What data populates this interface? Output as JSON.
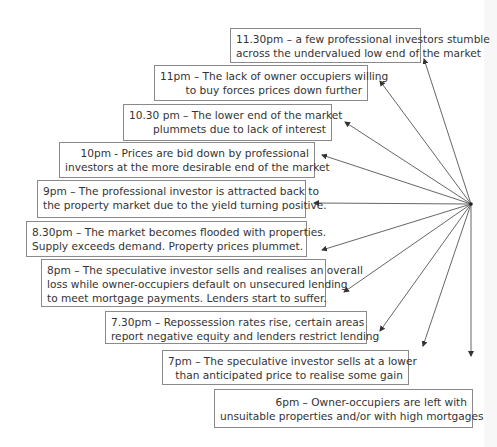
{
  "diagram": {
    "type": "radial-timeline",
    "focal_point": {
      "x": 471,
      "y": 204
    },
    "colors": {
      "line": "#555555",
      "box_border": "#8a8a8a",
      "text": "#333333",
      "background": "#ffffff"
    },
    "events": [
      {
        "time": "11.30pm",
        "lines": [
          "11.30pm – a few professional investors stumble",
          "across the undervalued low end of the market"
        ]
      },
      {
        "time": "11pm",
        "lines": [
          "11pm – The lack of owner occupiers willing",
          "to buy forces prices down further"
        ]
      },
      {
        "time": "10.30 pm",
        "lines": [
          "10.30 pm – The lower end of the market",
          "plummets due to lack of interest"
        ]
      },
      {
        "time": "10pm",
        "lines": [
          "10pm -  Prices are bid down by professional",
          "investors at the more desirable end of the market"
        ]
      },
      {
        "time": "9pm",
        "lines": [
          "9pm – The professional investor is attracted back to",
          "the property market due to the yield turning positive."
        ]
      },
      {
        "time": "8.30pm",
        "lines": [
          "8.30pm – The market becomes flooded with properties.",
          "Supply exceeds demand. Property prices plummet."
        ]
      },
      {
        "time": "8pm",
        "lines": [
          "8pm – The speculative investor sells and realises an overall",
          "loss while owner-occupiers default on unsecured lending",
          "to meet mortgage payments.  Lenders start to suffer."
        ]
      },
      {
        "time": "7.30pm",
        "lines": [
          "7.30pm – Repossession rates rise, certain areas",
          "report negative equity and lenders restrict lending"
        ]
      },
      {
        "time": "7pm",
        "lines": [
          "7pm – The speculative investor sells at a lower",
          "than anticipated price to realise some gain"
        ]
      },
      {
        "time": "6pm",
        "lines": [
          "6pm – Owner-occupiers are left with",
          "unsuitable properties and/or with high mortgages"
        ]
      }
    ]
  }
}
